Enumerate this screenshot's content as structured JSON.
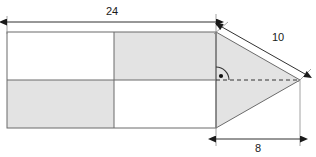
{
  "figure": {
    "background_color": "#ffffff",
    "stroke_color": "#6b6b6b",
    "shade_color": "#e3e3e3",
    "dimension_color": "#222222"
  },
  "labels": {
    "width_24": "24",
    "hypotenuse_10": "10",
    "base_8": "8"
  },
  "shapes": {
    "rectangle": {
      "name": "rectangle",
      "left": 7,
      "top": 32,
      "right": 216,
      "bottom": 128,
      "divider_x": 114,
      "divider_y": 80,
      "quadrants": [
        {
          "name": "top-left",
          "shaded": false
        },
        {
          "name": "top-right",
          "shaded": true
        },
        {
          "name": "bottom-left",
          "shaded": true
        },
        {
          "name": "bottom-right",
          "shaded": false
        }
      ]
    },
    "triangle": {
      "name": "triangle",
      "shaded": true,
      "vertices": [
        {
          "x": 216,
          "y": 32
        },
        {
          "x": 300,
          "y": 80
        },
        {
          "x": 216,
          "y": 128
        }
      ],
      "axis_dashed": {
        "from_x": 216,
        "from_y": 80,
        "to_x": 300,
        "to_y": 80
      },
      "right_angle_marker": {
        "x": 216,
        "y": 80,
        "radius": 13
      }
    }
  },
  "dimensions": [
    {
      "name": "top-width-dimension",
      "label": "24",
      "x1": 7,
      "y1": 22,
      "x2": 216,
      "y2": 22,
      "label_x": 112,
      "label_y": 15
    },
    {
      "name": "hypotenuse-dimension",
      "label": "10",
      "x1": 222,
      "y1": 27,
      "x2": 305,
      "y2": 74,
      "label_x": 278,
      "label_y": 41
    },
    {
      "name": "base-dimension",
      "label": "8",
      "x1": 216,
      "y1": 139,
      "x2": 300,
      "y2": 139,
      "label_x": 258,
      "label_y": 151
    }
  ]
}
